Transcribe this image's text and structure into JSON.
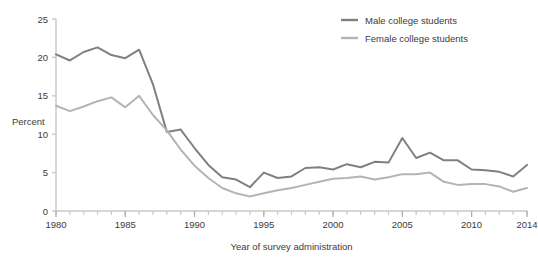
{
  "chart_data": {
    "type": "line",
    "title": "",
    "xlabel": "Year of survey administration",
    "ylabel": "Percent",
    "xlim": [
      1980,
      2014
    ],
    "ylim": [
      0,
      25
    ],
    "ytick_values": [
      0,
      5,
      10,
      15,
      20,
      25
    ],
    "ytick_labels": [
      "0",
      "5",
      "10",
      "15",
      "20",
      "25"
    ],
    "xtick_values": [
      1980,
      1985,
      1990,
      1995,
      2000,
      2005,
      2010,
      2014
    ],
    "xtick_labels": [
      "1980",
      "1985",
      "1990",
      "1995",
      "2000",
      "2005",
      "2010",
      "2014"
    ],
    "minor_xticks_every": 1,
    "grid": false,
    "legend_position": "top-right",
    "x": [
      1980,
      1981,
      1982,
      1983,
      1984,
      1985,
      1986,
      1987,
      1988,
      1989,
      1990,
      1991,
      1992,
      1993,
      1994,
      1995,
      1996,
      1997,
      1998,
      1999,
      2000,
      2001,
      2002,
      2003,
      2004,
      2005,
      2006,
      2007,
      2008,
      2009,
      2010,
      2011,
      2012,
      2013,
      2014
    ],
    "series": [
      {
        "name": "Male college students",
        "color": "#808080",
        "values": [
          20.4,
          19.6,
          20.7,
          21.3,
          20.3,
          19.9,
          21.0,
          16.5,
          10.3,
          10.6,
          8.2,
          6.0,
          4.4,
          4.1,
          3.1,
          5.0,
          4.3,
          4.5,
          5.6,
          5.7,
          5.4,
          6.1,
          5.7,
          6.4,
          6.3,
          9.5,
          6.9,
          7.6,
          6.6,
          6.6,
          5.4,
          5.3,
          5.1,
          4.5,
          6.0
        ]
      },
      {
        "name": "Female college students",
        "color": "#b4b4b4",
        "values": [
          13.7,
          13.0,
          13.6,
          14.3,
          14.8,
          13.5,
          15.0,
          12.5,
          10.5,
          8.0,
          5.9,
          4.3,
          3.0,
          2.3,
          1.9,
          2.3,
          2.7,
          3.0,
          3.4,
          3.8,
          4.2,
          4.3,
          4.5,
          4.1,
          4.4,
          4.8,
          4.8,
          5.0,
          3.8,
          3.4,
          3.5,
          3.5,
          3.2,
          2.5,
          3.0
        ]
      }
    ]
  },
  "legend": {
    "items": [
      {
        "label": "Male college students"
      },
      {
        "label": "Female college students"
      }
    ]
  }
}
